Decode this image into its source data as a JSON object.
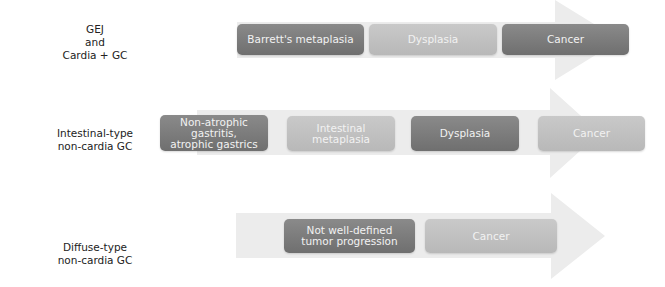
{
  "rows": [
    {
      "label": [
        "GEJ",
        "and",
        "Cardia + GC"
      ],
      "steps": [
        {
          "lines": [
            "Barrett's metaplasia"
          ],
          "shade": "dark"
        },
        {
          "lines": [
            "Dysplasia"
          ],
          "shade": "light"
        },
        {
          "lines": [
            "Cancer"
          ],
          "shade": "dark"
        }
      ]
    },
    {
      "label": [
        "Intestinal-type",
        "non-cardia GC"
      ],
      "steps": [
        {
          "lines": [
            "Non-atrophic",
            "gastritis,",
            "atrophic gastrics"
          ],
          "shade": "dark"
        },
        {
          "lines": [
            "Intestinal",
            "metaplasia"
          ],
          "shade": "light"
        },
        {
          "lines": [
            "Dysplasia"
          ],
          "shade": "dark"
        },
        {
          "lines": [
            "Cancer"
          ],
          "shade": "light"
        }
      ]
    },
    {
      "label": [
        "Diffuse-type",
        "non-cardia GC"
      ],
      "steps": [
        {
          "lines": [
            "Not well-defined",
            "tumor progression"
          ],
          "shade": "dark"
        },
        {
          "lines": [
            "Cancer"
          ],
          "shade": "light"
        }
      ]
    }
  ],
  "colors": {
    "arrow": "#ebebeb",
    "box_dark": "#7d7d7d",
    "box_light": "#c0c0c0",
    "box_text": "#f2f2f2",
    "label_text": "#222222"
  }
}
